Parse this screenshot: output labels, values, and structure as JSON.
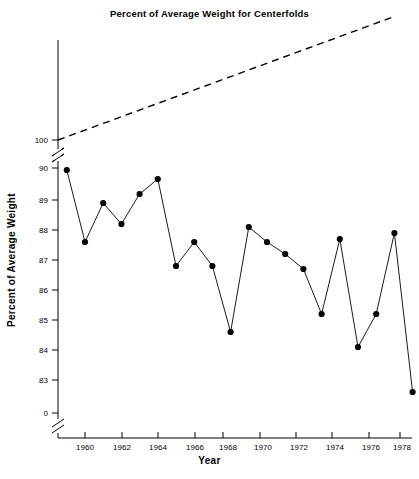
{
  "chart_data": {
    "type": "line",
    "title": "Percent of Average Weight for Centerfolds",
    "xlabel": "Year",
    "ylabel": "Percent of Average Weight",
    "grid": false,
    "legend": "none",
    "xlim": [
      1958.5,
      1978.8
    ],
    "ylim": [
      82.3,
      90.3
    ],
    "x_ticks": [
      1960,
      1962,
      1964,
      1966,
      1968,
      1970,
      1972,
      1974,
      1976,
      1978
    ],
    "x_tick_labels": [
      "1960",
      "1962",
      "1964",
      "1966",
      "1968",
      "1970",
      "1972",
      "1974",
      "1976",
      "1978"
    ],
    "y_ticks": [
      100,
      90,
      89,
      88,
      87,
      86,
      85,
      84,
      83,
      0
    ],
    "y_tick_labels": [
      "100",
      "90",
      "89",
      "88",
      "87",
      "86",
      "85",
      "84",
      "83",
      "0"
    ],
    "y_axis_breaks": [
      "between 100 and 90",
      "between 83 and 0"
    ],
    "x": [
      1959,
      1960,
      1961,
      1962,
      1963,
      1964,
      1965,
      1966,
      1967,
      1968,
      1969,
      1970,
      1971,
      1972,
      1973,
      1974,
      1975,
      1976,
      1977,
      1978
    ],
    "series": [
      {
        "name": "Percent of average weight",
        "style": "solid-line-with-filled-circle-markers",
        "color": "#000000",
        "values": [
          90.0,
          87.6,
          88.9,
          88.2,
          89.2,
          89.7,
          86.8,
          87.6,
          86.8,
          84.6,
          88.1,
          87.6,
          87.2,
          86.7,
          85.2,
          87.7,
          84.1,
          85.2,
          87.9,
          82.6
        ]
      },
      {
        "name": "Reference line at 100 percent (rising, dashed)",
        "style": "dashed-line",
        "color": "#000000",
        "note": "Dashed reference line drawn above the axis break, starting at the 100 tick on the left and rising to the upper right corner"
      }
    ]
  },
  "axes": {
    "title": "Percent of Average Weight for Centerfolds",
    "y_label": "Percent of Average Weight",
    "x_label": "Year"
  }
}
